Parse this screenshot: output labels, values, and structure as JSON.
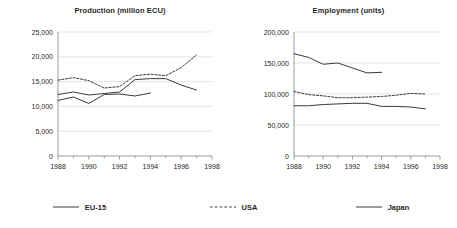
{
  "figure": {
    "width": 457,
    "height": 228,
    "background": "#ffffff",
    "axis_color": "#808080",
    "grid_color": "#d9d9d9",
    "text_color": "#1f1f1f"
  },
  "legend": {
    "position": "bottom",
    "items": [
      {
        "label": "EU-15",
        "style": "solid",
        "color": "#3a3a3a",
        "icon": "solid-line-swatch"
      },
      {
        "label": "USA",
        "style": "dashed",
        "color": "#3a3a3a",
        "icon": "dashed-line-swatch"
      },
      {
        "label": "Japan",
        "style": "solid",
        "color": "#3a3a3a",
        "icon": "solid-line-swatch"
      }
    ]
  },
  "chart_data": [
    {
      "id": "production",
      "type": "line",
      "title": "Production (million ECU)",
      "xlabel": "",
      "ylabel": "",
      "xlim": [
        1988,
        1998
      ],
      "ylim": [
        0,
        25000
      ],
      "xticks": [
        1988,
        1990,
        1992,
        1994,
        1996,
        1998
      ],
      "xticklabels": [
        "1988",
        "1990",
        "1992",
        "1994",
        "1996",
        "1998"
      ],
      "yticks": [
        0,
        5000,
        10000,
        15000,
        20000,
        25000
      ],
      "yticklabels": [
        "0",
        "5,000",
        "10,000",
        "15,000",
        "20,000",
        "25,000"
      ],
      "grid": true,
      "grid_axis": "y",
      "legend_position": "figure-bottom",
      "series": [
        {
          "name": "EU-15",
          "style": "solid",
          "color": "#3a3a3a",
          "x": [
            1988,
            1989,
            1990,
            1991,
            1992,
            1993,
            1994,
            1995,
            1996,
            1997
          ],
          "values": [
            12400,
            12900,
            12300,
            12600,
            12900,
            15400,
            15600,
            15600,
            14300,
            13300
          ]
        },
        {
          "name": "USA",
          "style": "dashed",
          "color": "#3a3a3a",
          "x": [
            1988,
            1989,
            1990,
            1991,
            1992,
            1993,
            1994,
            1995,
            1996,
            1997
          ],
          "values": [
            15300,
            15800,
            15200,
            13700,
            14000,
            16200,
            16500,
            16200,
            17800,
            20400
          ]
        },
        {
          "name": "Japan",
          "style": "solid",
          "color": "#3a3a3a",
          "x": [
            1988,
            1989,
            1990,
            1991,
            1992,
            1993,
            1994
          ],
          "values": [
            11200,
            11900,
            10600,
            12400,
            12500,
            12100,
            12700
          ]
        }
      ]
    },
    {
      "id": "employment",
      "type": "line",
      "title": "Employment (units)",
      "xlabel": "",
      "ylabel": "",
      "xlim": [
        1988,
        1998
      ],
      "ylim": [
        0,
        200000
      ],
      "xticks": [
        1988,
        1990,
        1992,
        1994,
        1996,
        1998
      ],
      "xticklabels": [
        "1988",
        "1990",
        "1992",
        "1994",
        "1996",
        "1998"
      ],
      "yticks": [
        0,
        50000,
        100000,
        150000,
        200000
      ],
      "yticklabels": [
        "0",
        "50,000",
        "100,000",
        "150,000",
        "200,000"
      ],
      "grid": true,
      "grid_axis": "y",
      "legend_position": "figure-bottom",
      "series": [
        {
          "name": "EU-15",
          "style": "solid",
          "color": "#3a3a3a",
          "x": [
            1988,
            1989,
            1990,
            1991,
            1992,
            1993,
            1994
          ],
          "values": [
            165000,
            159000,
            148000,
            150000,
            142000,
            134000,
            135000
          ]
        },
        {
          "name": "USA",
          "style": "dashed",
          "color": "#3a3a3a",
          "x": [
            1988,
            1989,
            1990,
            1991,
            1992,
            1993,
            1994,
            1995,
            1996,
            1997
          ],
          "values": [
            104000,
            99000,
            97000,
            94000,
            94000,
            95000,
            96000,
            98000,
            101000,
            100000
          ]
        },
        {
          "name": "Japan",
          "style": "solid",
          "color": "#3a3a3a",
          "x": [
            1988,
            1989,
            1990,
            1991,
            1992,
            1993,
            1994,
            1995,
            1996,
            1997
          ],
          "values": [
            81000,
            81000,
            83000,
            84000,
            85000,
            85000,
            80000,
            80000,
            79000,
            76000
          ]
        }
      ]
    }
  ]
}
